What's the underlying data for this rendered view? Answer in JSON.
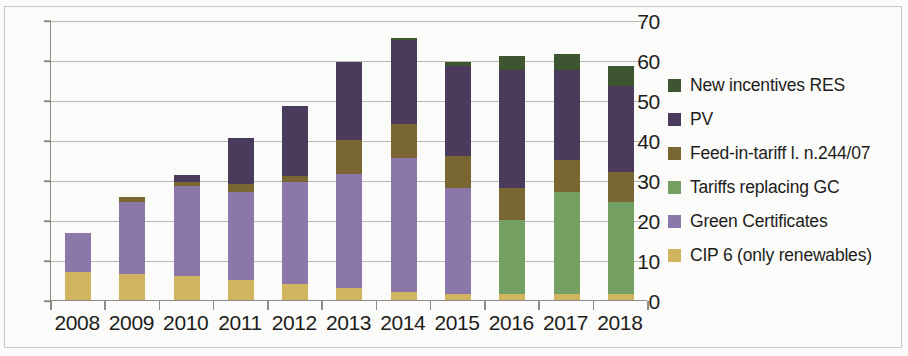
{
  "chart_data": {
    "type": "bar",
    "subtype": "stacked-bar",
    "title": "",
    "xlabel": "",
    "ylabel": "",
    "ylim": [
      0,
      70
    ],
    "ytick_step": 10,
    "yticks": [
      0,
      10,
      20,
      30,
      40,
      50,
      60,
      70
    ],
    "grid": true,
    "legend_position": "right",
    "categories": [
      "2008",
      "2009",
      "2010",
      "2011",
      "2012",
      "2013",
      "2014",
      "2015",
      "2016",
      "2017",
      "2018"
    ],
    "series": [
      {
        "name": "CIP 6 (only renewables)",
        "color": "#D0B460",
        "values": [
          7.0,
          6.5,
          6.0,
          5.0,
          4.0,
          3.0,
          2.0,
          1.5,
          1.5,
          1.5,
          1.5
        ]
      },
      {
        "name": "Green Certificates",
        "color": "#8B77A9",
        "values": [
          9.8,
          18.0,
          22.5,
          22.0,
          25.5,
          28.5,
          33.5,
          26.5,
          0,
          0,
          0
        ]
      },
      {
        "name": "Tariffs replacing GC",
        "color": "#74A063",
        "values": [
          0,
          0,
          0,
          0,
          0,
          0,
          0,
          0,
          18.5,
          25.5,
          23.0
        ]
      },
      {
        "name": "Feed-in-tariff l. n.244/07",
        "color": "#7A6630",
        "values": [
          0,
          1.3,
          1.0,
          2.0,
          1.5,
          8.5,
          8.5,
          8.0,
          8.0,
          8.0,
          7.5
        ]
      },
      {
        "name": "PV",
        "color": "#4A3A5C",
        "values": [
          0,
          0,
          1.8,
          11.5,
          17.5,
          19.5,
          21.0,
          22.5,
          29.5,
          22.5,
          21.5
        ]
      },
      {
        "name": "New incentives RES",
        "color": "#3E5531",
        "values": [
          0,
          0,
          0,
          0,
          0,
          0,
          0.5,
          1.0,
          3.5,
          4.0,
          5.0
        ]
      }
    ],
    "totals": [
      16.8,
      25.8,
      31.3,
      40.5,
      48.5,
      59.5,
      65.5,
      59.5,
      61.0,
      61.5,
      58.5
    ]
  },
  "legend": {
    "items": [
      {
        "label": "New incentives RES",
        "color": "#3E5531"
      },
      {
        "label": "PV",
        "color": "#4A3A5C"
      },
      {
        "label": "Feed-in-tariff l. n.244/07",
        "color": "#7A6630"
      },
      {
        "label": "Tariffs replacing GC",
        "color": "#74A063"
      },
      {
        "label": "Green Certificates",
        "color": "#8B77A9"
      },
      {
        "label": "CIP 6 (only renewables)",
        "color": "#D0B460"
      }
    ]
  }
}
